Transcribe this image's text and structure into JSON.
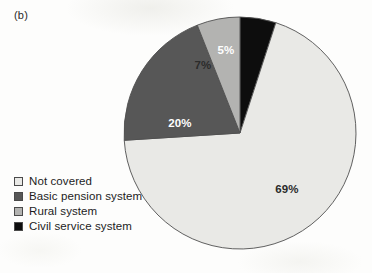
{
  "figure": {
    "panel_label": "(b)",
    "background_color": "#fdfdfc"
  },
  "chart_data": {
    "type": "pie",
    "title": "",
    "subtitle": "",
    "xlabel": "",
    "ylabel": "",
    "grid": false,
    "legend_position": "bottom-left",
    "start_angle_deg": 0,
    "direction": "clockwise",
    "units": "percent",
    "categories": [
      "Civil service system",
      "Not covered",
      "Basic pension system",
      "Rural system"
    ],
    "values": [
      5,
      69,
      20,
      7
    ],
    "data_labels": [
      "5%",
      "69%",
      "20%",
      "7%"
    ],
    "colors": [
      "#0d0d0d",
      "#e9e9e6",
      "#575757",
      "#b3b3b1"
    ],
    "label_colors": [
      "#ffffff",
      "#2b2b2b",
      "#ffffff",
      "#2b2b2b"
    ],
    "slices": [
      {
        "name": "Civil service system",
        "value": 5,
        "label": "5%",
        "color": "#0d0d0d",
        "label_color": "#ffffff",
        "start_deg": 0,
        "end_deg": 18,
        "label_x": 226,
        "label_y": 51
      },
      {
        "name": "Not covered",
        "value": 69,
        "label": "69%",
        "color": "#e9e9e6",
        "label_color": "#2b2b2b",
        "start_deg": 18,
        "end_deg": 266.4,
        "label_x": 287,
        "label_y": 190
      },
      {
        "name": "Basic pension system",
        "value": 20,
        "label": "20%",
        "color": "#575757",
        "label_color": "#ffffff",
        "start_deg": 266.4,
        "end_deg": 338.4,
        "label_x": 180,
        "label_y": 124
      },
      {
        "name": "Rural system",
        "value": 7,
        "label": "7%",
        "color": "#b3b3b1",
        "label_color": "#2b2b2b",
        "start_deg": 338.4,
        "end_deg": 360,
        "label_x": 203,
        "label_y": 66
      }
    ]
  },
  "legend": {
    "items": [
      {
        "label": "Not covered",
        "color": "#e9e9e6"
      },
      {
        "label": "Basic pension system",
        "color": "#575757"
      },
      {
        "label": "Rural system",
        "color": "#b3b3b1"
      },
      {
        "label": "Civil service system",
        "color": "#0d0d0d"
      }
    ]
  }
}
